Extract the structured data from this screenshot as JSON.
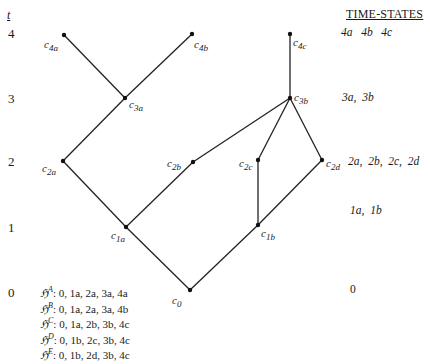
{
  "diagram": {
    "axis": {
      "label": "t",
      "ticks": [
        "4",
        "3",
        "2",
        "1",
        "0"
      ]
    },
    "nodes": [
      {
        "id": "c0",
        "label": "c",
        "sub": "0"
      },
      {
        "id": "c1a",
        "label": "c",
        "sub": "1a"
      },
      {
        "id": "c1b",
        "label": "c",
        "sub": "1b"
      },
      {
        "id": "c2a",
        "label": "c",
        "sub": "2a"
      },
      {
        "id": "c2b",
        "label": "c",
        "sub": "2b"
      },
      {
        "id": "c2c",
        "label": "c",
        "sub": "2c"
      },
      {
        "id": "c2d",
        "label": "c",
        "sub": "2d"
      },
      {
        "id": "c3a",
        "label": "c",
        "sub": "3a"
      },
      {
        "id": "c3b",
        "label": "c",
        "sub": "3b"
      },
      {
        "id": "c4a",
        "label": "c",
        "sub": "4a"
      },
      {
        "id": "c4b",
        "label": "c",
        "sub": "4b"
      },
      {
        "id": "c4c",
        "label": "c",
        "sub": "4c"
      }
    ],
    "edges": [
      [
        "c0",
        "c1a"
      ],
      [
        "c0",
        "c1b"
      ],
      [
        "c1a",
        "c2a"
      ],
      [
        "c1a",
        "c2b"
      ],
      [
        "c1b",
        "c2c"
      ],
      [
        "c1b",
        "c2d"
      ],
      [
        "c2a",
        "c3a"
      ],
      [
        "c2b",
        "c3b"
      ],
      [
        "c2c",
        "c3b"
      ],
      [
        "c2d",
        "c3b"
      ],
      [
        "c3a",
        "c4a"
      ],
      [
        "c3a",
        "c4b"
      ],
      [
        "c3b",
        "c4c"
      ]
    ],
    "time_states": {
      "title": "TIME-STATES",
      "rows": [
        "4a   4b   4c",
        "3a,  3b",
        "2a,  2b,  2c,  2d",
        "1a,  1b",
        "0"
      ]
    },
    "histories": [
      {
        "symbol": "ℌ",
        "sup": "A",
        "path": ": 0, 1a, 2a, 3a, 4a"
      },
      {
        "symbol": "ℌ",
        "sup": "B",
        "path": ": 0, 1a, 2a, 3a, 4b"
      },
      {
        "symbol": "ℌ",
        "sup": "C",
        "path": ": 0, 1a, 2b, 3b, 4c"
      },
      {
        "symbol": "ℌ",
        "sup": "D",
        "path": ": 0, 1b, 2c, 3b, 4c"
      },
      {
        "symbol": "ℌ",
        "sup": "E",
        "path": ": 0, 1b, 2d, 3b, 4c"
      }
    ]
  }
}
